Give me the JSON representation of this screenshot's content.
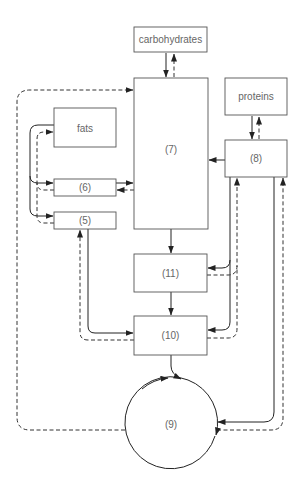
{
  "diagram": {
    "nodes": {
      "carbohydrates": {
        "label": "carbohydrates"
      },
      "proteins": {
        "label": "proteins"
      },
      "fats": {
        "label": "fats"
      },
      "n5": {
        "label": "(5)"
      },
      "n6": {
        "label": "(6)"
      },
      "n7": {
        "label": "(7)"
      },
      "n8": {
        "label": "(8)"
      },
      "n9": {
        "label": "(9)"
      },
      "n10": {
        "label": "(10)"
      },
      "n11": {
        "label": "(11)"
      }
    },
    "edges": [
      {
        "from": "carbohydrates",
        "to": "(7)",
        "style": "solid"
      },
      {
        "from": "(7)",
        "to": "carbohydrates",
        "style": "dashed"
      },
      {
        "from": "proteins",
        "to": "(8)",
        "style": "solid"
      },
      {
        "from": "(8)",
        "to": "proteins",
        "style": "dashed"
      },
      {
        "from": "(8)",
        "to": "(7)",
        "style": "solid"
      },
      {
        "from": "fats",
        "to": "(6)",
        "style": "solid"
      },
      {
        "from": "fats",
        "to": "(5)",
        "style": "solid"
      },
      {
        "from": "(6)",
        "to": "fats",
        "style": "dashed"
      },
      {
        "from": "(5)",
        "to": "fats",
        "style": "dashed"
      },
      {
        "from": "(6)",
        "to": "(7)",
        "style": "solid"
      },
      {
        "from": "(7)",
        "to": "(6)",
        "style": "dashed"
      },
      {
        "from": "(7)",
        "to": "(11)",
        "style": "solid"
      },
      {
        "from": "(11)",
        "to": "(10)",
        "style": "solid"
      },
      {
        "from": "(5)",
        "to": "(10)",
        "style": "solid"
      },
      {
        "from": "(10)",
        "to": "(5)",
        "style": "dashed"
      },
      {
        "from": "(8)",
        "to": "(11)",
        "style": "solid"
      },
      {
        "from": "(11)",
        "to": "(8)",
        "style": "dashed"
      },
      {
        "from": "(8)",
        "to": "(10)",
        "style": "solid"
      },
      {
        "from": "(10)",
        "to": "(8)",
        "style": "dashed"
      },
      {
        "from": "(10)",
        "to": "(9)",
        "style": "solid"
      },
      {
        "from": "(8)",
        "to": "(9)",
        "style": "solid"
      },
      {
        "from": "(9)",
        "to": "(8)",
        "style": "dashed"
      },
      {
        "from": "(9)",
        "to": "(7)",
        "style": "dashed"
      }
    ],
    "colors": {
      "line": "#222222",
      "box_border": "#555555",
      "label": "#666666"
    }
  }
}
